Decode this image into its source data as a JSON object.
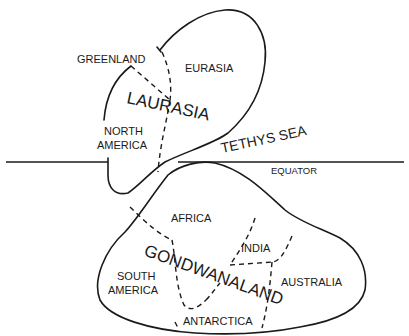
{
  "diagram": {
    "supercontinents": [
      {
        "name": "LAURASIA",
        "regions": [
          "GREENLAND",
          "EURASIA",
          "NORTH AMERICA"
        ]
      },
      {
        "name": "GONDWANALAND",
        "regions": [
          "AFRICA",
          "INDIA",
          "AUSTRALIA",
          "SOUTH AMERICA",
          "ANTARCTICA"
        ]
      }
    ],
    "labels": {
      "greenland": "GREENLAND",
      "eurasia": "EURASIA",
      "laurasia": "LAURASIA",
      "north": "NORTH",
      "america_n": "AMERICA",
      "tethys": "TETHYS SEA",
      "equator": "EQUATOR",
      "africa": "AFRICA",
      "india": "INDIA",
      "gondwanaland": "GONDWANALAND",
      "south": "SOUTH",
      "america_s": "AMERICA",
      "australia": "AUSTRALIA",
      "antarctica": "ANTARCTICA"
    },
    "colors": {
      "ink": "#1a1a1a",
      "background": "#ffffff"
    }
  }
}
